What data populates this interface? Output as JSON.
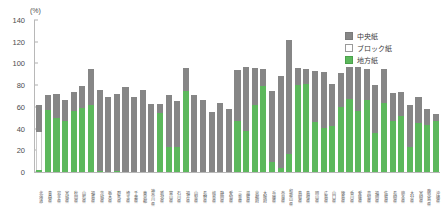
{
  "chart_data": {
    "type": "bar",
    "stacked": true,
    "title": "",
    "subtitle": "",
    "unit_label": "(%)",
    "xlabel": "",
    "ylabel": "",
    "ylim": [
      0,
      140
    ],
    "ytick_values": [
      0,
      20,
      40,
      60,
      80,
      100,
      120,
      140
    ],
    "ytick_labels": [
      "0",
      "20",
      "40",
      "60",
      "80",
      "100",
      "120",
      "140"
    ],
    "grid": false,
    "legend_position": "top-right",
    "legend": [
      {
        "label": "中央紙",
        "color": "#868686"
      },
      {
        "label": "ブロック紙",
        "color": "#ffffff"
      },
      {
        "label": "地方紙",
        "color": "#5cb85c"
      }
    ],
    "categories": [
      "北海道",
      "青森県",
      "岩手県",
      "宮城県",
      "秋田県",
      "山形県",
      "福島県",
      "茨城県",
      "栃木県",
      "群馬県",
      "埼玉県",
      "千葉県",
      "東京都",
      "神奈川県",
      "新潟県",
      "富山県",
      "石川県",
      "福井県",
      "山梨県",
      "長野県",
      "岐阜県",
      "静岡県",
      "愛知県",
      "三重県",
      "滋賀県",
      "京都府",
      "大阪府",
      "兵庫県",
      "奈良県",
      "和歌山県",
      "鳥取県",
      "島根県",
      "岡山県",
      "広島県",
      "山口県",
      "徳島県",
      "香川県",
      "愛媛県",
      "高知県",
      "福岡県",
      "佐賀県",
      "長崎県",
      "熊本県",
      "大分県",
      "宮崎県",
      "鹿児島県",
      "沖縄県"
    ],
    "series": [
      {
        "name": "地方紙",
        "color": "#5cb85c",
        "values": [
          2,
          57,
          50,
          47,
          56,
          59,
          62,
          1,
          0,
          1,
          0,
          0,
          0,
          0,
          54,
          23,
          23,
          75,
          0,
          0,
          0,
          0,
          0,
          47,
          38,
          62,
          79,
          9,
          4,
          17,
          80,
          81,
          46,
          41,
          42,
          60,
          67,
          56,
          66,
          36,
          64,
          47,
          52,
          23,
          45,
          43,
          47
        ]
      },
      {
        "name": "ブロック紙",
        "color": "#ffffff",
        "values": [
          35,
          0,
          0,
          0,
          0,
          0,
          0,
          0,
          0,
          0,
          0,
          0,
          0,
          0,
          0,
          0,
          0,
          0,
          0,
          0,
          0,
          0,
          0,
          0,
          0,
          0,
          0,
          0,
          0,
          0,
          0,
          0,
          0,
          0,
          0,
          0,
          0,
          0,
          0,
          0,
          0,
          0,
          0,
          0,
          0,
          0,
          0
        ]
      },
      {
        "name": "中央紙",
        "color": "#868686",
        "values": [
          25,
          14,
          22,
          19,
          18,
          20,
          33,
          75,
          69,
          71,
          78,
          69,
          76,
          63,
          9,
          48,
          42,
          21,
          71,
          66,
          55,
          64,
          58,
          47,
          59,
          34,
          16,
          66,
          84,
          105,
          16,
          14,
          47,
          51,
          39,
          31,
          30,
          41,
          29,
          44,
          31,
          26,
          22,
          39,
          24,
          15,
          6
        ]
      }
    ],
    "totals": [
      62,
      71,
      72,
      66,
      74,
      79,
      95,
      76,
      69,
      72,
      78,
      69,
      76,
      63,
      63,
      71,
      65,
      96,
      71,
      66,
      55,
      64,
      58,
      94,
      97,
      96,
      95,
      75,
      88,
      122,
      96,
      95,
      93,
      92,
      81,
      91,
      97,
      97,
      95,
      80,
      95,
      73,
      74,
      62,
      69,
      58,
      53
    ],
    "note": "Newspaper diffusion rate by prefecture, split into national papers, block papers, and local papers"
  }
}
